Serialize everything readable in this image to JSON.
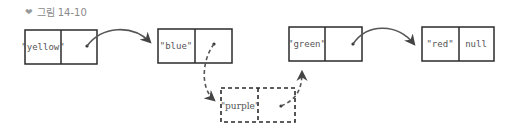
{
  "caption": {
    "icon": "chevron-down-icon",
    "glyph": "❤",
    "text": "그림 14-10"
  },
  "colors": {
    "stroke": "#2b2b2b",
    "text": "#555555",
    "caption": "#8a8a8a"
  },
  "nodes": [
    {
      "id": "yellow",
      "value": "\"yellow\"",
      "next": "•",
      "dashed": false
    },
    {
      "id": "blue",
      "value": "\"blue\"",
      "next": "•",
      "dashed": false
    },
    {
      "id": "purple",
      "value": "\"purple\"",
      "next": "•",
      "dashed": true
    },
    {
      "id": "green",
      "value": "\"green\"",
      "next": "•",
      "dashed": false
    },
    {
      "id": "red",
      "value": "\"red\"",
      "next": "null",
      "dashed": false
    }
  ]
}
